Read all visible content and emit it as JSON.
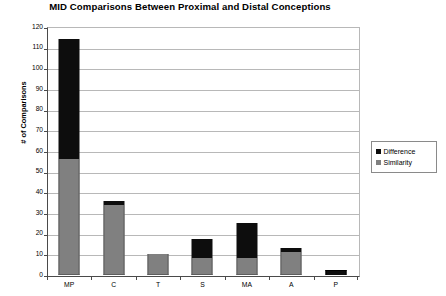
{
  "chart_data": {
    "type": "bar",
    "title": "MID Comparisons Between Proximal and Distal Conceptions",
    "xlabel": "",
    "ylabel": "# of Comparisons",
    "ylim": [
      0,
      120
    ],
    "ytick_step": 10,
    "yticks": [
      120,
      110,
      100,
      90,
      80,
      70,
      60,
      50,
      40,
      30,
      20,
      10,
      0
    ],
    "grid": true,
    "stacked": true,
    "legend_position": "right",
    "categories": [
      "MP",
      "C",
      "T",
      "S",
      "MA",
      "A",
      "P"
    ],
    "series": [
      {
        "name": "Similarity",
        "color": "#808080",
        "values": [
          56,
          34,
          10,
          8,
          8,
          11,
          0
        ]
      },
      {
        "name": "Difference",
        "color": "#0d0d0d",
        "values": [
          58,
          2,
          0,
          9.5,
          17,
          2,
          2.5
        ]
      }
    ],
    "totals": [
      114,
      36,
      10,
      17.5,
      25,
      13,
      2.5
    ]
  },
  "legend": {
    "items": [
      {
        "label": "Difference",
        "color": "#0d0d0d"
      },
      {
        "label": "Similarity",
        "color": "#808080"
      }
    ]
  }
}
